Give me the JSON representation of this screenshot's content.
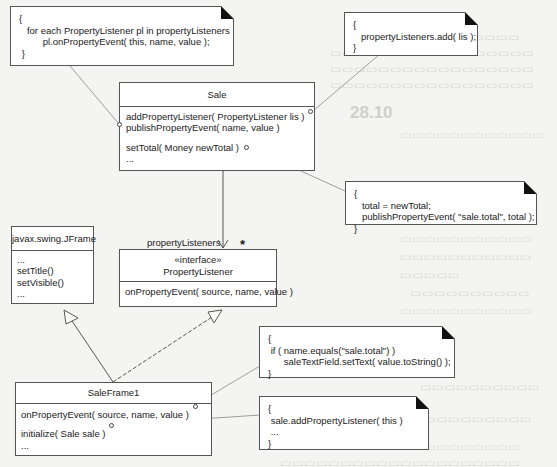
{
  "diagram": {
    "type": "UML class diagram",
    "classes": {
      "sale": {
        "name": "Sale",
        "operations": [
          "addPropertyListener( PropertyListener lis )",
          "publishPropertyEvent( name, value )",
          "setTotal( Money newTotal )",
          "..."
        ]
      },
      "jframe": {
        "name": "javax.swing.JFrame",
        "operations": [
          "...",
          "setTitle()",
          "setVisible()",
          "..."
        ]
      },
      "property_listener": {
        "stereotype": "«interface»",
        "name": "PropertyListener",
        "operations": [
          "onPropertyEvent( source, name, value )"
        ]
      },
      "sale_frame1": {
        "name": "SaleFrame1",
        "operations": [
          "onPropertyEvent( source, name, value )",
          "initialize( Sale sale )",
          "..."
        ]
      }
    },
    "association": {
      "role": "propertyListeners",
      "multiplicity": "*"
    },
    "notes": {
      "publish": [
        "{",
        "   for each PropertyListener pl in propertyListeners",
        "         pl.onPropertyEvent( this, name, value );",
        " }"
      ],
      "add": [
        "{",
        "   propertyListeners.add( lis );",
        "}"
      ],
      "set_total": [
        "{",
        "   total = newTotal;",
        "   publishPropertyEvent( \"sale.total\", total );",
        "}"
      ],
      "on_event": [
        "{",
        " if ( name.equals(\"sale.total\") )",
        "      saleTextField.setText( value.toString() );",
        "}"
      ],
      "initialize": [
        "{",
        " sale.addPropertyListener( this )",
        " ...",
        "}"
      ]
    }
  },
  "background": {
    "heading": "28.10"
  }
}
